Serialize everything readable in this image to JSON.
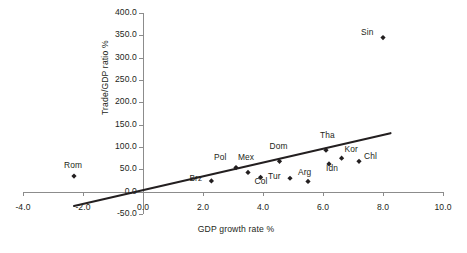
{
  "chart_data": {
    "type": "scatter",
    "title": "",
    "xlabel": "GDP growth rate %",
    "ylabel": "Trade/GDP ratio %",
    "xlim": [
      -4.0,
      10.0
    ],
    "ylim": [
      -50.0,
      400.0
    ],
    "xticks": [
      "-4.0",
      "-2.0",
      "0.0",
      "2.0",
      "4.0",
      "6.0",
      "8.0",
      "10.0"
    ],
    "xtick_values": [
      -4.0,
      -2.0,
      0.0,
      2.0,
      4.0,
      6.0,
      8.0,
      10.0
    ],
    "yticks": [
      "400.0",
      "350.0",
      "300.0",
      "250.0",
      "200.0",
      "150.0",
      "100.0",
      "50.0",
      "0.0",
      "-50.0"
    ],
    "ytick_values": [
      400.0,
      350.0,
      300.0,
      250.0,
      200.0,
      150.0,
      100.0,
      50.0,
      0.0,
      -50.0
    ],
    "grid": false,
    "legend": "none",
    "marker": "diamond",
    "marker_color": "#231f20",
    "axis_color": "#8c8c8c",
    "text_color": "#231f20",
    "trendline": {
      "label": "",
      "color": "#231f20",
      "x_start": -2.3,
      "y_start": -32.0,
      "x_end": 8.25,
      "y_end": 131.0
    },
    "points": [
      {
        "label": "Rom",
        "x": -2.3,
        "y": 35.0,
        "label_dx": -10,
        "label_dy": -12
      },
      {
        "label": "Brz",
        "x": 2.28,
        "y": 24.0,
        "label_dx": -22,
        "label_dy": -4
      },
      {
        "label": "Pol",
        "x": 3.1,
        "y": 54.0,
        "label_dx": -22,
        "label_dy": -12
      },
      {
        "label": "Mex",
        "x": 3.5,
        "y": 43.0,
        "label_dx": -10,
        "label_dy": -16
      },
      {
        "label": "Col",
        "x": 3.92,
        "y": 32.0,
        "label_dx": -6,
        "label_dy": 3
      },
      {
        "label": "Dom",
        "x": 4.55,
        "y": 68.0,
        "label_dx": -10,
        "label_dy": -16
      },
      {
        "label": "Tur",
        "x": 4.9,
        "y": 30.0,
        "label_dx": -22,
        "label_dy": -3
      },
      {
        "label": "Arg",
        "x": 5.5,
        "y": 23.0,
        "label_dx": -10,
        "label_dy": -10
      },
      {
        "label": "Tha",
        "x": 6.1,
        "y": 93.0,
        "label_dx": -6,
        "label_dy": -16
      },
      {
        "label": "Idn",
        "x": 6.2,
        "y": 62.0,
        "label_dx": -3,
        "label_dy": 3
      },
      {
        "label": "Kor",
        "x": 6.62,
        "y": 75.0,
        "label_dx": 3,
        "label_dy": -10
      },
      {
        "label": "Chl",
        "x": 7.2,
        "y": 68.0,
        "label_dx": 5,
        "label_dy": -6
      },
      {
        "label": "Sin",
        "x": 8.0,
        "y": 345.0,
        "label_dx": -22,
        "label_dy": -7
      }
    ]
  },
  "figure": {
    "source_note": ""
  }
}
